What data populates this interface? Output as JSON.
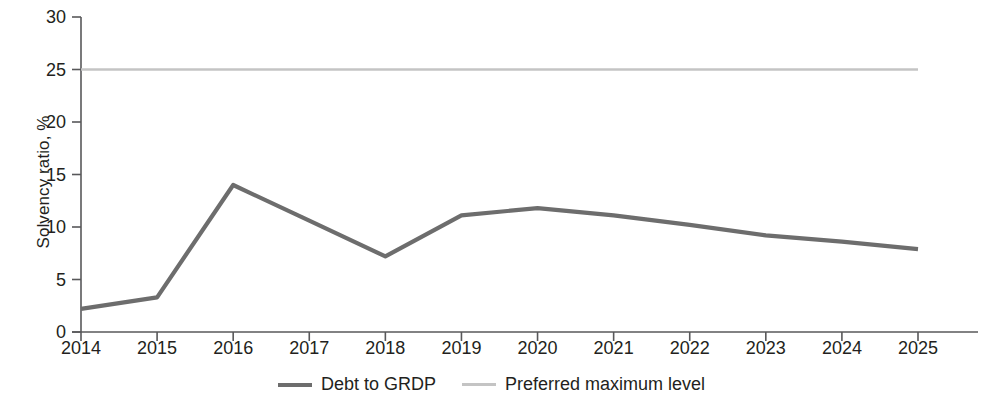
{
  "chart_data": {
    "type": "line",
    "title": "",
    "subtitle": "",
    "xlabel": "",
    "ylabel": "Solvency ratio, %",
    "categories": [
      "2014",
      "2015",
      "2016",
      "2017",
      "2018",
      "2019",
      "2020",
      "2021",
      "2022",
      "2023",
      "2024",
      "2025"
    ],
    "x": [
      2014,
      2015,
      2016,
      2017,
      2018,
      2019,
      2020,
      2021,
      2022,
      2023,
      2024,
      2025
    ],
    "xlim": [
      2014,
      2025
    ],
    "ylim": [
      0,
      30
    ],
    "yticks": [
      0,
      5,
      10,
      15,
      20,
      25,
      30
    ],
    "ytick_labels": [
      "0",
      "5",
      "10",
      "15",
      "20",
      "25",
      "30"
    ],
    "grid": false,
    "legend_position": "bottom-center",
    "series": [
      {
        "name": "Debt to GRDP",
        "color": "#6d6d6d",
        "width": 4,
        "values": [
          2.2,
          3.3,
          14.0,
          10.6,
          7.2,
          11.1,
          11.8,
          11.1,
          10.2,
          9.2,
          8.6,
          7.9
        ]
      },
      {
        "name": "Preferred maximum level",
        "color": "#c4c4c4",
        "width": 2,
        "values": [
          25.0,
          25.0,
          25.0,
          25.0,
          25.0,
          25.0,
          25.0,
          25.0,
          25.0,
          25.0,
          25.0,
          25.0
        ]
      }
    ]
  },
  "legend": {
    "items": [
      {
        "label": "Debt to GRDP",
        "color": "#6d6d6d"
      },
      {
        "label": "Preferred maximum level",
        "color": "#c4c4c4"
      }
    ]
  },
  "axes": {
    "axis_color": "#58585a",
    "text_color": "#231f20"
  }
}
